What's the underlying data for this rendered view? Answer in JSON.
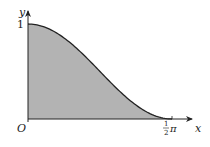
{
  "figure": {
    "function": "y = cos^2(x)",
    "x_range": [
      0,
      1.5707963
    ],
    "y_range": [
      0,
      1
    ],
    "shaded_region": "area under curve between x=0 and x=1/2 pi",
    "fill_color": "#b3b3b3",
    "curve_color": "#222222",
    "axis_color": "#222222"
  },
  "labels": {
    "y_axis": "y",
    "x_axis": "x",
    "origin": "O",
    "y_tick_1": "1",
    "x_tick_num": "1",
    "x_tick_den": "2",
    "x_tick_pi": "π"
  }
}
